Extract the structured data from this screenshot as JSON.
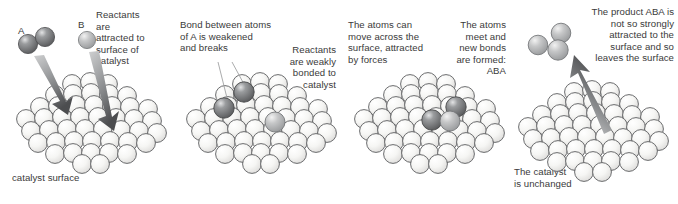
{
  "figure": {
    "background_color": "#ffffff",
    "text_color": "#3a3a3a",
    "panel_count": 4
  },
  "palette": {
    "lattice_fill_light": "#f7f7f5",
    "lattice_fill_mid": "#e9e9e6",
    "lattice_stroke": "#58585a",
    "atom_dark_fill": "#6f7072",
    "atom_dark_highlight": "#d8d9da",
    "atom_mid_fill": "#b9babb",
    "atom_mid_highlight": "#ececec",
    "arrow_fill": "#6b6c6e",
    "arrow_light": "#c9cacb",
    "leader_line": "#9a9b9d"
  },
  "panels": [
    {
      "id": "panel-1",
      "name": "adsorption",
      "label_a": "A",
      "label_b": "B",
      "caption_right": "Reactants\nare\nattracted to\nsurface of\ncatalyst",
      "caption_bottom": "catalyst surface",
      "arrows": 2,
      "free_molecule": "A2",
      "free_atom": "B"
    },
    {
      "id": "panel-2",
      "name": "bond-breaking",
      "caption_left": "Bond between atoms\nof A is weakened\nand breaks",
      "caption_right": "Reactants\nare weakly\nbonded to\ncatalyst",
      "adsorbed_dark_atoms": 2,
      "adsorbed_mid_atoms": 1
    },
    {
      "id": "panel-3",
      "name": "surface-diffusion-and-bond-formation",
      "caption_left": "The atoms can\nmove across the\nsurface, attracted\nby forces",
      "caption_right": "The atoms\nmeet and\nnew bonds\nare formed:\nABA",
      "product_formula": "ABA",
      "adsorbed_dark_atoms": 2,
      "adsorbed_mid_atoms": 1
    },
    {
      "id": "panel-4",
      "name": "desorption",
      "caption_right": "The product ABA is\nnot so strongly\nattracted to the\nsurface and so\nleaves the surface",
      "caption_bottom": "The catalyst\nis unchanged",
      "product_formula": "ABA",
      "arrows": 1
    }
  ]
}
